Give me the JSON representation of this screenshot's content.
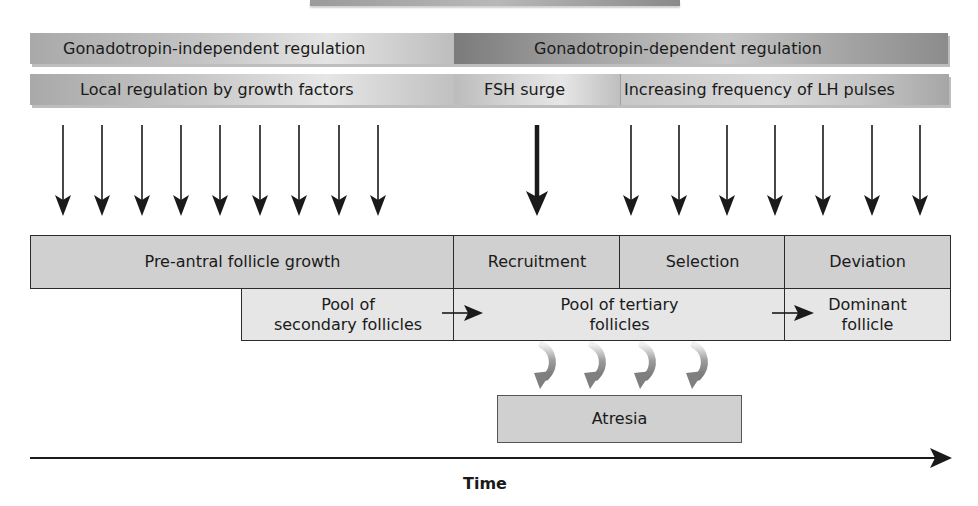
{
  "top_stub": {
    "label": ""
  },
  "regulation_bands": {
    "row1": [
      {
        "label": "Gonadotropin-independent regulation"
      },
      {
        "label": "Gonadotropin-dependent regulation"
      }
    ],
    "row2": [
      {
        "label": "Local regulation by growth factors"
      },
      {
        "label": "FSH surge"
      },
      {
        "label": "Increasing frequency of LH pulses"
      }
    ]
  },
  "signal_arrows": {
    "growth_factor_arrows": {
      "count": 9,
      "style": "thin",
      "x_positions": [
        63,
        102,
        142,
        181,
        220,
        260,
        299,
        339,
        378
      ]
    },
    "fsh_arrow": {
      "count": 1,
      "style": "thick",
      "x_positions": [
        537
      ]
    },
    "lh_arrows": {
      "count": 7,
      "style": "thin",
      "x_positions": [
        631,
        679,
        727,
        775,
        823,
        872,
        920
      ]
    }
  },
  "stages": [
    {
      "label": "Pre-antral follicle growth"
    },
    {
      "label": "Recruitment"
    },
    {
      "label": "Selection"
    },
    {
      "label": "Deviation"
    }
  ],
  "pools": [
    {
      "label": "Pool of\nsecondary follicles",
      "line1": "Pool of",
      "line2": "secondary follicles"
    },
    {
      "label": "Pool of tertiary\nfollicles",
      "line1": "Pool of tertiary",
      "line2": "follicles"
    },
    {
      "label": "Dominant\nfollicle",
      "line1": "Dominant",
      "line2": "follicle"
    }
  ],
  "transitions": [
    {
      "from": "Pool of secondary follicles",
      "to": "Pool of tertiary follicles"
    },
    {
      "from": "Pool of tertiary follicles",
      "to": "Dominant follicle"
    }
  ],
  "atresia": {
    "label": "Atresia",
    "curved_arrow_count": 4
  },
  "timeline": {
    "label": "Time"
  },
  "colors": {
    "stage_fill": "#d0d0d0",
    "pool_fill": "#e6e6e6",
    "border": "#2b2b2b",
    "arrow": "#1a1a1a",
    "curved_arrow": "#8a8a8a"
  }
}
